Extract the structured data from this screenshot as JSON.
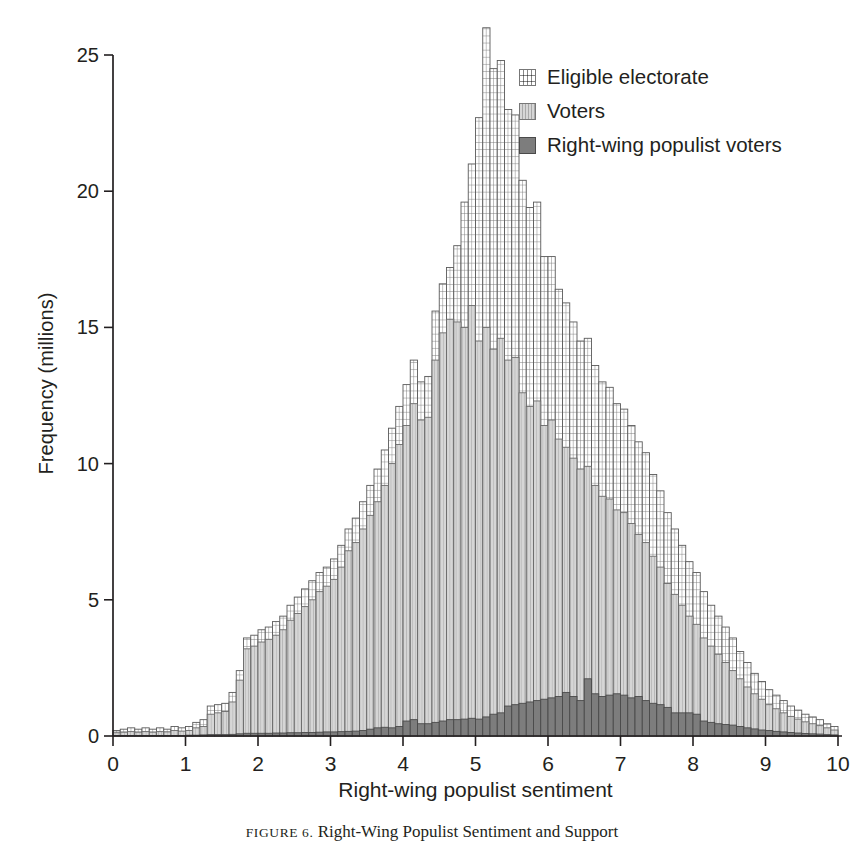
{
  "chart_data": {
    "type": "bar",
    "title": "",
    "subtitle": "",
    "xlabel": "Right-wing populist sentiment",
    "ylabel": "Frequency (millions)",
    "xlim": [
      0,
      10
    ],
    "ylim": [
      0,
      26.5
    ],
    "xticks": [
      0,
      1,
      2,
      3,
      4,
      5,
      6,
      7,
      8,
      9,
      10
    ],
    "yticks": [
      0,
      5,
      10,
      15,
      20,
      25
    ],
    "grid": false,
    "legend_position": "top-right",
    "bin_width": 0.1,
    "stacked": false,
    "note": "Three overlaid histograms of right-wing populist sentiment (0-10). Each value is the bin frequency in millions; bins are 0.1 wide starting at x=0.",
    "x": [
      0.05,
      0.15,
      0.25,
      0.35,
      0.45,
      0.55,
      0.65,
      0.75,
      0.85,
      0.95,
      1.05,
      1.15,
      1.25,
      1.35,
      1.45,
      1.55,
      1.65,
      1.75,
      1.85,
      1.95,
      2.05,
      2.15,
      2.25,
      2.35,
      2.45,
      2.55,
      2.65,
      2.75,
      2.85,
      2.95,
      3.05,
      3.15,
      3.25,
      3.35,
      3.45,
      3.55,
      3.65,
      3.75,
      3.85,
      3.95,
      4.05,
      4.15,
      4.25,
      4.35,
      4.45,
      4.55,
      4.65,
      4.75,
      4.85,
      4.95,
      5.05,
      5.15,
      5.25,
      5.35,
      5.45,
      5.55,
      5.65,
      5.75,
      5.85,
      5.95,
      6.05,
      6.15,
      6.25,
      6.35,
      6.45,
      6.55,
      6.65,
      6.75,
      6.85,
      6.95,
      7.05,
      7.15,
      7.25,
      7.35,
      7.45,
      7.55,
      7.65,
      7.75,
      7.85,
      7.95,
      8.05,
      8.15,
      8.25,
      8.35,
      8.45,
      8.55,
      8.65,
      8.75,
      8.85,
      8.95,
      9.05,
      9.15,
      9.25,
      9.35,
      9.45,
      9.55,
      9.65,
      9.75,
      9.85,
      9.95
    ],
    "series": [
      {
        "name": "Eligible electorate",
        "fill": "#ffffff",
        "pattern": "grid",
        "edge": "#5a5a5a",
        "values": [
          0.2,
          0.25,
          0.3,
          0.25,
          0.3,
          0.25,
          0.3,
          0.25,
          0.35,
          0.3,
          0.35,
          0.5,
          0.6,
          1.1,
          1.15,
          1.2,
          1.6,
          2.4,
          3.6,
          3.7,
          3.9,
          4.0,
          4.2,
          4.4,
          4.8,
          5.1,
          5.4,
          5.7,
          6.0,
          6.2,
          6.5,
          7.0,
          7.6,
          8.0,
          8.6,
          9.2,
          9.8,
          10.5,
          11.3,
          12.1,
          12.9,
          13.8,
          13.0,
          13.2,
          15.6,
          16.6,
          17.2,
          18.0,
          19.6,
          21.0,
          22.7,
          26.0,
          24.5,
          24.8,
          23.0,
          22.8,
          20.4,
          19.4,
          19.6,
          17.6,
          17.6,
          16.4,
          15.9,
          15.2,
          14.5,
          14.6,
          13.6,
          13.0,
          12.8,
          12.2,
          12.0,
          11.4,
          10.8,
          10.4,
          9.6,
          9.0,
          8.2,
          7.6,
          7.0,
          6.4,
          6.0,
          5.3,
          4.8,
          4.4,
          4.0,
          3.6,
          3.1,
          2.7,
          2.3,
          2.0,
          1.7,
          1.5,
          1.3,
          1.1,
          0.95,
          0.8,
          0.7,
          0.6,
          0.45,
          0.35
        ]
      },
      {
        "name": "Voters",
        "fill": "#d2d2d2",
        "pattern": "vlines",
        "edge": "#6a6a6a",
        "values": [
          0.12,
          0.14,
          0.16,
          0.14,
          0.16,
          0.14,
          0.16,
          0.15,
          0.2,
          0.18,
          0.2,
          0.3,
          0.35,
          0.8,
          0.85,
          0.9,
          1.25,
          2.05,
          3.2,
          3.3,
          3.45,
          3.55,
          3.7,
          3.9,
          4.25,
          4.5,
          4.75,
          5.0,
          5.3,
          5.5,
          5.75,
          6.2,
          6.8,
          7.1,
          7.6,
          8.1,
          8.6,
          9.2,
          10.0,
          10.7,
          11.4,
          12.2,
          11.6,
          11.7,
          13.8,
          14.8,
          15.3,
          15.2,
          15.0,
          15.8,
          14.5,
          15.0,
          14.2,
          14.6,
          13.8,
          13.9,
          12.6,
          12.1,
          12.3,
          11.4,
          11.6,
          10.9,
          10.6,
          10.2,
          9.8,
          9.9,
          9.2,
          8.8,
          8.7,
          8.3,
          8.2,
          7.8,
          7.4,
          7.1,
          6.6,
          6.2,
          5.6,
          5.2,
          4.8,
          4.4,
          4.1,
          3.6,
          3.3,
          3.0,
          2.7,
          2.4,
          2.1,
          1.8,
          1.55,
          1.35,
          1.15,
          1.0,
          0.85,
          0.72,
          0.62,
          0.52,
          0.45,
          0.38,
          0.3,
          0.22
        ]
      },
      {
        "name": "Right-wing populist voters",
        "fill": "#7d7d7d",
        "pattern": "solid",
        "edge": "#4a4a4a",
        "values": [
          0.02,
          0.02,
          0.02,
          0.02,
          0.02,
          0.02,
          0.02,
          0.02,
          0.02,
          0.02,
          0.03,
          0.03,
          0.04,
          0.05,
          0.05,
          0.05,
          0.06,
          0.08,
          0.1,
          0.1,
          0.1,
          0.1,
          0.11,
          0.11,
          0.12,
          0.12,
          0.13,
          0.13,
          0.14,
          0.15,
          0.15,
          0.16,
          0.17,
          0.18,
          0.2,
          0.25,
          0.3,
          0.32,
          0.3,
          0.35,
          0.55,
          0.6,
          0.45,
          0.45,
          0.5,
          0.55,
          0.6,
          0.6,
          0.62,
          0.65,
          0.62,
          0.7,
          0.8,
          0.85,
          1.1,
          1.15,
          1.2,
          1.25,
          1.3,
          1.35,
          1.4,
          1.45,
          1.6,
          1.45,
          1.3,
          2.1,
          1.55,
          1.45,
          1.5,
          1.55,
          1.5,
          1.4,
          1.45,
          1.3,
          1.2,
          1.15,
          1.05,
          0.85,
          0.85,
          0.85,
          0.8,
          0.55,
          0.5,
          0.45,
          0.42,
          0.4,
          0.35,
          0.3,
          0.26,
          0.22,
          0.2,
          0.17,
          0.15,
          0.13,
          0.11,
          0.09,
          0.08,
          0.07,
          0.05,
          0.04
        ]
      }
    ]
  },
  "axes": {
    "y_title": "Frequency (millions)",
    "x_title": "Right-wing populist sentiment",
    "y_tick_labels": [
      "0",
      "5",
      "10",
      "15",
      "20",
      "25"
    ],
    "x_tick_labels": [
      "0",
      "1",
      "2",
      "3",
      "4",
      "5",
      "6",
      "7",
      "8",
      "9",
      "10"
    ]
  },
  "legend": {
    "items": [
      {
        "label": "Eligible electorate",
        "color": "#ffffff",
        "pattern": "grid"
      },
      {
        "label": "Voters",
        "color": "#d2d2d2",
        "pattern": "vlines"
      },
      {
        "label": "Right-wing populist voters",
        "color": "#7d7d7d",
        "pattern": "solid"
      }
    ]
  },
  "caption": {
    "figure_label": "FIGURE 6.",
    "text": "Right-Wing Populist Sentiment and Support"
  }
}
